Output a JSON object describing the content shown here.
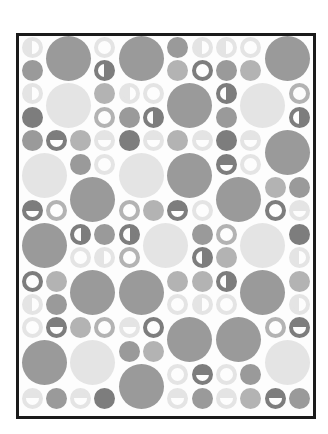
{
  "colors": {
    "dark": "#7d7d7d",
    "mid": "#9a9a9a",
    "light": "#b3b3b3",
    "pale": "#e4e4e4",
    "white": "#fdfdfd",
    "frame": "#1a1a1a"
  },
  "grid": {
    "cols": 12,
    "rows": 16,
    "col0_x": 32,
    "col_pitch": 24.3,
    "row0_y": 47,
    "row_pitch": 23.4,
    "small_d": 21,
    "large_d": 45
  },
  "circles": [
    {
      "r": 0,
      "c": 0,
      "t": "halfv",
      "s": "pale"
    },
    {
      "r": 0,
      "c": 1,
      "t": "large",
      "s": "mid"
    },
    {
      "r": 0,
      "c": 3,
      "t": "ring",
      "s": "pale"
    },
    {
      "r": 0,
      "c": 4,
      "t": "large",
      "s": "mid"
    },
    {
      "r": 0,
      "c": 6,
      "t": "solid",
      "s": "mid"
    },
    {
      "r": 0,
      "c": 7,
      "t": "halfv",
      "s": "pale"
    },
    {
      "r": 0,
      "c": 8,
      "t": "halfv",
      "s": "pale"
    },
    {
      "r": 0,
      "c": 9,
      "t": "ring",
      "s": "pale"
    },
    {
      "r": 0,
      "c": 10,
      "t": "large",
      "s": "mid"
    },
    {
      "r": 1,
      "c": 0,
      "t": "solid",
      "s": "mid"
    },
    {
      "r": 1,
      "c": 3,
      "t": "halfvr",
      "s": "dark"
    },
    {
      "r": 1,
      "c": 6,
      "t": "solid",
      "s": "light"
    },
    {
      "r": 1,
      "c": 7,
      "t": "ring",
      "s": "dark"
    },
    {
      "r": 1,
      "c": 8,
      "t": "solid",
      "s": "mid"
    },
    {
      "r": 1,
      "c": 9,
      "t": "solid",
      "s": "light"
    },
    {
      "r": 2,
      "c": 0,
      "t": "halfv",
      "s": "pale"
    },
    {
      "r": 2,
      "c": 1,
      "t": "large",
      "s": "pale"
    },
    {
      "r": 2,
      "c": 3,
      "t": "solid",
      "s": "light"
    },
    {
      "r": 2,
      "c": 4,
      "t": "halfv",
      "s": "pale"
    },
    {
      "r": 2,
      "c": 5,
      "t": "ring",
      "s": "pale"
    },
    {
      "r": 2,
      "c": 6,
      "t": "large",
      "s": "mid"
    },
    {
      "r": 2,
      "c": 8,
      "t": "halfvr",
      "s": "dark"
    },
    {
      "r": 2,
      "c": 9,
      "t": "large",
      "s": "pale"
    },
    {
      "r": 2,
      "c": 11,
      "t": "ring",
      "s": "light"
    },
    {
      "r": 3,
      "c": 0,
      "t": "solid",
      "s": "dark"
    },
    {
      "r": 3,
      "c": 3,
      "t": "ring",
      "s": "light"
    },
    {
      "r": 3,
      "c": 4,
      "t": "solid",
      "s": "mid"
    },
    {
      "r": 3,
      "c": 5,
      "t": "halfvr",
      "s": "dark"
    },
    {
      "r": 3,
      "c": 8,
      "t": "solid",
      "s": "mid"
    },
    {
      "r": 3,
      "c": 11,
      "t": "halfvr",
      "s": "dark"
    },
    {
      "r": 4,
      "c": 0,
      "t": "solid",
      "s": "mid"
    },
    {
      "r": 4,
      "c": 1,
      "t": "halfh",
      "s": "dark"
    },
    {
      "r": 4,
      "c": 2,
      "t": "solid",
      "s": "light"
    },
    {
      "r": 4,
      "c": 3,
      "t": "halfh",
      "s": "pale"
    },
    {
      "r": 4,
      "c": 4,
      "t": "solid",
      "s": "dark"
    },
    {
      "r": 4,
      "c": 5,
      "t": "halfh",
      "s": "pale"
    },
    {
      "r": 4,
      "c": 6,
      "t": "solid",
      "s": "light"
    },
    {
      "r": 4,
      "c": 7,
      "t": "halfh",
      "s": "pale"
    },
    {
      "r": 4,
      "c": 8,
      "t": "solid",
      "s": "dark"
    },
    {
      "r": 4,
      "c": 9,
      "t": "halfh",
      "s": "pale"
    },
    {
      "r": 4,
      "c": 10,
      "t": "large",
      "s": "mid"
    },
    {
      "r": 5,
      "c": 0,
      "t": "large",
      "s": "pale"
    },
    {
      "r": 5,
      "c": 2,
      "t": "solid",
      "s": "mid"
    },
    {
      "r": 5,
      "c": 3,
      "t": "ring",
      "s": "pale"
    },
    {
      "r": 5,
      "c": 4,
      "t": "large",
      "s": "pale"
    },
    {
      "r": 5,
      "c": 6,
      "t": "large",
      "s": "mid"
    },
    {
      "r": 5,
      "c": 8,
      "t": "halfh",
      "s": "dark"
    },
    {
      "r": 5,
      "c": 9,
      "t": "ring",
      "s": "pale"
    },
    {
      "r": 6,
      "c": 2,
      "t": "large",
      "s": "mid"
    },
    {
      "r": 6,
      "c": 8,
      "t": "large",
      "s": "mid"
    },
    {
      "r": 6,
      "c": 10,
      "t": "solid",
      "s": "light"
    },
    {
      "r": 6,
      "c": 11,
      "t": "solid",
      "s": "mid"
    },
    {
      "r": 7,
      "c": 0,
      "t": "halfh",
      "s": "dark"
    },
    {
      "r": 7,
      "c": 1,
      "t": "ring",
      "s": "light"
    },
    {
      "r": 7,
      "c": 4,
      "t": "ring",
      "s": "light"
    },
    {
      "r": 7,
      "c": 5,
      "t": "solid",
      "s": "light"
    },
    {
      "r": 7,
      "c": 6,
      "t": "halfh",
      "s": "dark"
    },
    {
      "r": 7,
      "c": 7,
      "t": "ring",
      "s": "pale"
    },
    {
      "r": 7,
      "c": 10,
      "t": "ring",
      "s": "dark"
    },
    {
      "r": 7,
      "c": 11,
      "t": "halfh",
      "s": "pale"
    },
    {
      "r": 8,
      "c": 0,
      "t": "large",
      "s": "mid"
    },
    {
      "r": 8,
      "c": 2,
      "t": "halfvr",
      "s": "dark"
    },
    {
      "r": 8,
      "c": 3,
      "t": "solid",
      "s": "mid"
    },
    {
      "r": 8,
      "c": 4,
      "t": "halfvr",
      "s": "dark"
    },
    {
      "r": 8,
      "c": 5,
      "t": "large",
      "s": "pale"
    },
    {
      "r": 8,
      "c": 7,
      "t": "solid",
      "s": "mid"
    },
    {
      "r": 8,
      "c": 8,
      "t": "ring",
      "s": "light"
    },
    {
      "r": 8,
      "c": 9,
      "t": "large",
      "s": "pale"
    },
    {
      "r": 8,
      "c": 11,
      "t": "solid",
      "s": "dark"
    },
    {
      "r": 9,
      "c": 2,
      "t": "ring",
      "s": "pale"
    },
    {
      "r": 9,
      "c": 3,
      "t": "halfv",
      "s": "pale"
    },
    {
      "r": 9,
      "c": 4,
      "t": "ring",
      "s": "light"
    },
    {
      "r": 9,
      "c": 7,
      "t": "halfvr",
      "s": "dark"
    },
    {
      "r": 9,
      "c": 8,
      "t": "solid",
      "s": "light"
    },
    {
      "r": 9,
      "c": 11,
      "t": "halfv",
      "s": "pale"
    },
    {
      "r": 10,
      "c": 0,
      "t": "ring",
      "s": "dark"
    },
    {
      "r": 10,
      "c": 1,
      "t": "solid",
      "s": "light"
    },
    {
      "r": 10,
      "c": 2,
      "t": "large",
      "s": "mid"
    },
    {
      "r": 10,
      "c": 4,
      "t": "large",
      "s": "mid"
    },
    {
      "r": 10,
      "c": 6,
      "t": "solid",
      "s": "light"
    },
    {
      "r": 10,
      "c": 7,
      "t": "solid",
      "s": "light"
    },
    {
      "r": 10,
      "c": 8,
      "t": "halfvr",
      "s": "dark"
    },
    {
      "r": 10,
      "c": 9,
      "t": "large",
      "s": "mid"
    },
    {
      "r": 10,
      "c": 11,
      "t": "solid",
      "s": "light"
    },
    {
      "r": 11,
      "c": 0,
      "t": "halfv",
      "s": "pale"
    },
    {
      "r": 11,
      "c": 1,
      "t": "solid",
      "s": "mid"
    },
    {
      "r": 11,
      "c": 6,
      "t": "ring",
      "s": "pale"
    },
    {
      "r": 11,
      "c": 7,
      "t": "halfv",
      "s": "pale"
    },
    {
      "r": 11,
      "c": 8,
      "t": "ring",
      "s": "pale"
    },
    {
      "r": 11,
      "c": 11,
      "t": "halfv",
      "s": "pale"
    },
    {
      "r": 12,
      "c": 0,
      "t": "ring",
      "s": "pale"
    },
    {
      "r": 12,
      "c": 1,
      "t": "halfh",
      "s": "dark"
    },
    {
      "r": 12,
      "c": 2,
      "t": "solid",
      "s": "light"
    },
    {
      "r": 12,
      "c": 3,
      "t": "ring",
      "s": "light"
    },
    {
      "r": 12,
      "c": 4,
      "t": "halfh",
      "s": "pale"
    },
    {
      "r": 12,
      "c": 5,
      "t": "ring",
      "s": "dark"
    },
    {
      "r": 12,
      "c": 6,
      "t": "large",
      "s": "mid"
    },
    {
      "r": 12,
      "c": 8,
      "t": "large",
      "s": "mid"
    },
    {
      "r": 12,
      "c": 10,
      "t": "ring",
      "s": "light"
    },
    {
      "r": 12,
      "c": 11,
      "t": "halfh",
      "s": "dark"
    },
    {
      "r": 13,
      "c": 0,
      "t": "large",
      "s": "mid"
    },
    {
      "r": 13,
      "c": 2,
      "t": "large",
      "s": "pale"
    },
    {
      "r": 13,
      "c": 4,
      "t": "solid",
      "s": "mid"
    },
    {
      "r": 13,
      "c": 5,
      "t": "solid",
      "s": "light"
    },
    {
      "r": 13,
      "c": 10,
      "t": "large",
      "s": "pale"
    },
    {
      "r": 14,
      "c": 4,
      "t": "large",
      "s": "mid"
    },
    {
      "r": 14,
      "c": 6,
      "t": "ring",
      "s": "pale"
    },
    {
      "r": 14,
      "c": 7,
      "t": "halfh",
      "s": "dark"
    },
    {
      "r": 14,
      "c": 8,
      "t": "ring",
      "s": "pale"
    },
    {
      "r": 14,
      "c": 9,
      "t": "solid",
      "s": "mid"
    },
    {
      "r": 15,
      "c": 0,
      "t": "halfh",
      "s": "pale"
    },
    {
      "r": 15,
      "c": 1,
      "t": "solid",
      "s": "mid"
    },
    {
      "r": 15,
      "c": 2,
      "t": "halfh",
      "s": "pale"
    },
    {
      "r": 15,
      "c": 3,
      "t": "solid",
      "s": "dark"
    },
    {
      "r": 15,
      "c": 6,
      "t": "halfh",
      "s": "pale"
    },
    {
      "r": 15,
      "c": 7,
      "t": "solid",
      "s": "mid"
    },
    {
      "r": 15,
      "c": 8,
      "t": "halfh",
      "s": "pale"
    },
    {
      "r": 15,
      "c": 9,
      "t": "solid",
      "s": "light"
    },
    {
      "r": 15,
      "c": 10,
      "t": "halfh",
      "s": "dark"
    },
    {
      "r": 15,
      "c": 11,
      "t": "solid",
      "s": "mid"
    }
  ]
}
